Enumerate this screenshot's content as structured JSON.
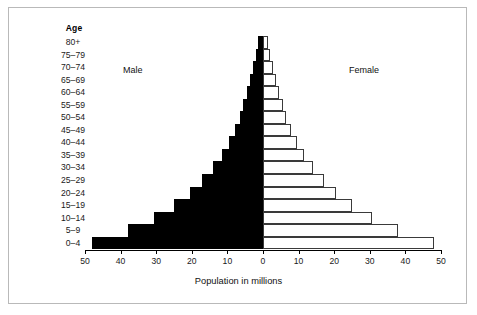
{
  "frame": {
    "border_color": "#b9b9b9",
    "background": "#ffffff"
  },
  "labels": {
    "age_header": "Age",
    "male_heading": "Male",
    "female_heading": "Female"
  },
  "chart_data": {
    "type": "bar",
    "subtype": "population-pyramid",
    "title": "",
    "xlabel": "Population in millions",
    "ylabel": "Age",
    "xlim": [
      -50,
      50
    ],
    "grid": false,
    "legend_position": "inline-headings",
    "axis_tick_values": [
      50,
      40,
      30,
      20,
      10,
      0,
      10,
      20,
      30,
      40,
      50
    ],
    "axis_tick_labels": [
      "50",
      "40",
      "30",
      "20",
      "10",
      "0",
      "10",
      "20",
      "30",
      "40",
      "50"
    ],
    "colors": {
      "male_fill": "#000000",
      "female_fill": "#ffffff",
      "female_stroke": "#3a3a3a",
      "axis": "#000000"
    },
    "categories": [
      "80+",
      "75–79",
      "70–74",
      "65–69",
      "60–64",
      "55–59",
      "50–54",
      "45–49",
      "40–44",
      "35–39",
      "30–34",
      "25–29",
      "20–24",
      "15–19",
      "10–14",
      "5–9",
      "0–4"
    ],
    "series": [
      {
        "name": "Male",
        "side": "left",
        "values": [
          1.5,
          2.0,
          2.8,
          3.6,
          4.5,
          5.5,
          6.6,
          8.0,
          9.6,
          11.5,
          14.0,
          17.0,
          20.5,
          25.0,
          30.5,
          38.0,
          48.0
        ]
      },
      {
        "name": "Female",
        "side": "right",
        "values": [
          1.5,
          2.0,
          2.8,
          3.6,
          4.5,
          5.5,
          6.6,
          8.0,
          9.6,
          11.5,
          14.0,
          17.0,
          20.5,
          25.0,
          30.5,
          38.0,
          48.0
        ]
      }
    ]
  }
}
